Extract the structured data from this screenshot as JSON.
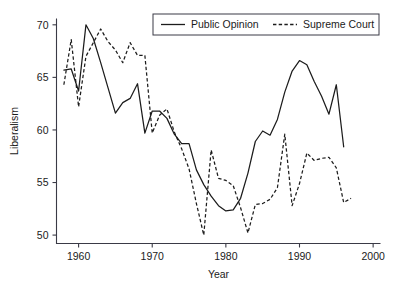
{
  "chart_data": {
    "type": "line",
    "title": "",
    "xlabel": "Year",
    "ylabel": "Liberalism",
    "xlim": [
      1957,
      2001
    ],
    "ylim": [
      49.2,
      70.6
    ],
    "xticks": [
      1960,
      1970,
      1980,
      1990,
      2000
    ],
    "yticks": [
      50,
      55,
      60,
      65,
      70
    ],
    "grid": false,
    "legend_position": "top-right",
    "series": [
      {
        "name": "Public Opinion",
        "style": "solid",
        "color": "#1c1c1c",
        "x": [
          1958,
          1959,
          1960,
          1961,
          1962,
          1963,
          1964,
          1965,
          1966,
          1967,
          1968,
          1969,
          1970,
          1971,
          1972,
          1973,
          1974,
          1975,
          1976,
          1977,
          1978,
          1979,
          1980,
          1981,
          1982,
          1983,
          1984,
          1985,
          1986,
          1987,
          1988,
          1989,
          1990,
          1991,
          1992,
          1993,
          1994,
          1995,
          1996
        ],
        "values": [
          65.7,
          65.8,
          63.7,
          70.0,
          68.7,
          66.4,
          64.0,
          61.6,
          62.6,
          63.0,
          64.4,
          59.7,
          61.8,
          61.8,
          61.1,
          59.6,
          58.7,
          58.7,
          56.2,
          54.8,
          53.7,
          52.8,
          52.3,
          52.4,
          53.5,
          55.9,
          58.9,
          59.9,
          59.5,
          61.0,
          63.6,
          65.6,
          66.6,
          66.2,
          64.6,
          63.2,
          61.5,
          64.3,
          58.4
        ]
      },
      {
        "name": "Supreme Court",
        "style": "dashed",
        "color": "#1c1c1c",
        "x": [
          1958,
          1959,
          1960,
          1961,
          1962,
          1963,
          1964,
          1965,
          1966,
          1967,
          1968,
          1969,
          1970,
          1971,
          1972,
          1973,
          1974,
          1975,
          1976,
          1977,
          1978,
          1979,
          1980,
          1981,
          1982,
          1983,
          1984,
          1985,
          1986,
          1987,
          1988,
          1989,
          1990,
          1991,
          1992,
          1993,
          1994,
          1995,
          1996,
          1997
        ],
        "values": [
          64.3,
          68.6,
          62.2,
          67.0,
          68.3,
          69.6,
          68.4,
          67.6,
          66.4,
          68.3,
          67.1,
          67.1,
          59.7,
          61.4,
          62.0,
          59.8,
          58.2,
          56.3,
          53.0,
          50.0,
          58.1,
          55.4,
          55.2,
          54.7,
          52.6,
          50.2,
          52.9,
          53.0,
          53.4,
          54.5,
          59.6,
          52.8,
          54.9,
          57.8,
          57.1,
          57.3,
          57.4,
          56.4,
          53.1,
          53.5
        ]
      }
    ]
  },
  "legend": {
    "entries": [
      {
        "label": "Public Opinion",
        "style": "solid"
      },
      {
        "label": "Supreme Court",
        "style": "dashed"
      }
    ]
  },
  "axes": {
    "x_title": "Year",
    "y_title": "Liberalism",
    "x_tick_labels": [
      "1960",
      "1970",
      "1980",
      "1990",
      "2000"
    ],
    "y_tick_labels": [
      "50",
      "55",
      "60",
      "65",
      "70"
    ]
  }
}
